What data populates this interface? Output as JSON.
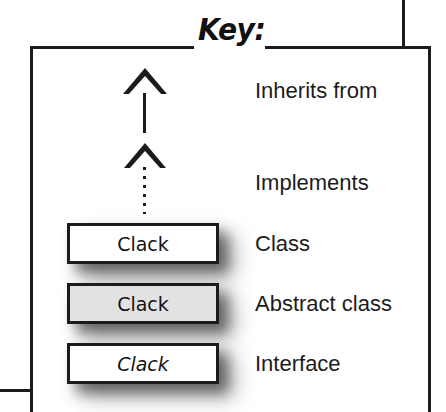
{
  "diagram": {
    "title": "Key:",
    "type": "uml-legend",
    "entries": [
      {
        "symbol": "solid-line-hollow-triangle-arrow",
        "label": "Inherits from",
        "box_text": null,
        "style": "solid"
      },
      {
        "symbol": "dotted-line-hollow-triangle-arrow",
        "label": "Implements",
        "box_text": null,
        "style": "dotted"
      },
      {
        "symbol": "rectangle-white",
        "label": "Class",
        "box_text": "Clack",
        "style": "plain"
      },
      {
        "symbol": "rectangle-gray",
        "label": "Abstract class",
        "box_text": "Clack",
        "style": "plain"
      },
      {
        "symbol": "rectangle-white-italic",
        "label": "Interface",
        "box_text": "Clack",
        "style": "italic"
      }
    ],
    "colors": {
      "stroke": "#1b1b1b",
      "class_fill": "#ffffff",
      "abstract_fill": "#e2e2e2",
      "interface_fill": "#ffffff",
      "text": "#1c1c1c",
      "background": "#ffffff"
    }
  }
}
